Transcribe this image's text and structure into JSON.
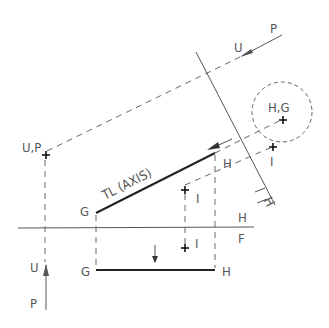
{
  "diagram": {
    "type": "descriptive-geometry-projection",
    "labels": {
      "p_top": "P",
      "u_top": "U",
      "up_left": "U,P",
      "hg_circle": "H,G",
      "i_right": "I",
      "h_aux": "H",
      "tl_axis": "TL (AXIS)",
      "g_top": "G",
      "h_top": "H",
      "i_top": "I",
      "h_fold": "H",
      "f_fold": "F",
      "i_bottom": "I",
      "u_bottom": "U",
      "p_bottom": "P",
      "g_bottom": "G",
      "h_bottom": "H",
      "fold_h_slanted": "H",
      "fold_1_slanted": "1"
    },
    "colors": {
      "line": "#555555",
      "object_line": "#222222",
      "background": "#ffffff"
    }
  }
}
